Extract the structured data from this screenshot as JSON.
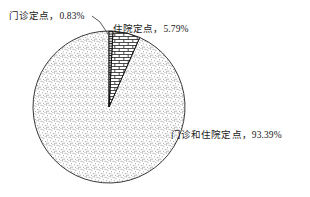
{
  "chart_data": {
    "type": "pie",
    "title": "",
    "subtitle": "",
    "xlabel": "",
    "ylabel": "",
    "legend_position": "none",
    "grid": false,
    "units": "percent",
    "total": 100,
    "start_angle_deg": 0,
    "direction": "clockwise",
    "categories": [
      "门诊定点",
      "住院定点",
      "门诊和住院定点"
    ],
    "values": [
      0.83,
      5.79,
      93.39
    ],
    "slices": [
      {
        "name": "门诊定点",
        "value": 0.83,
        "value_text": "0.83%",
        "label": "门诊定点，0.83%",
        "pattern": "horizontal-hatch",
        "fill": "#e8e8e8",
        "stroke": "#111111",
        "has_leader_line": true
      },
      {
        "name": "住院定点",
        "value": 5.79,
        "value_text": "5.79%",
        "label": "住院定点，5.79%",
        "pattern": "brick",
        "fill": "#ffffff",
        "stroke": "#111111",
        "has_leader_line": false
      },
      {
        "name": "门诊和住院定点",
        "value": 93.39,
        "value_text": "93.39%",
        "label": "门诊和住院定点，93.39%",
        "pattern": "stipple",
        "fill": "#fdfdfd",
        "stroke": "#333333",
        "has_leader_line": false
      }
    ],
    "annotations": [
      "门诊定点，0.83%",
      "住院定点，5.79%",
      "门诊和住院定点，93.39%"
    ]
  },
  "labels": {
    "outpatient": "门诊定点，0.83%",
    "inpatient": "住院定点，5.79%",
    "both": "门诊和住院定点，93.39%"
  },
  "colors": {
    "outline": "#333333",
    "text": "#1a1a1a",
    "leader_line": "#444444",
    "background": "#ffffff"
  }
}
